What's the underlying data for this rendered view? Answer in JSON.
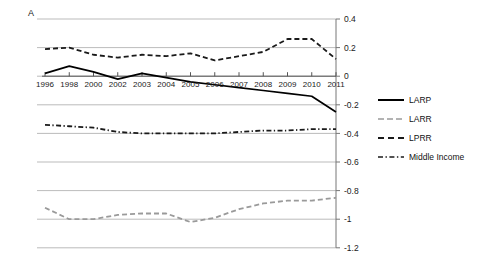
{
  "panel": {
    "label": "A"
  },
  "chart_data": {
    "type": "line",
    "title": "",
    "xlabel": "",
    "ylabel": "",
    "x": [
      1996,
      1998,
      2000,
      2002,
      2003,
      2004,
      2005,
      2006,
      2007,
      2008,
      2009,
      2010,
      2011
    ],
    "xtick_labels": [
      "1996",
      "1998",
      "2000",
      "2002",
      "2003",
      "2004",
      "2005",
      "2006",
      "2007",
      "2008",
      "2009",
      "2010",
      "2011"
    ],
    "ytick_labels": [
      "0.4",
      "0.2",
      "0",
      "-0.2",
      "-0.4",
      "-0.6",
      "-0.8",
      "-1",
      "-1.2"
    ],
    "ytick_values": [
      0.4,
      0.2,
      0,
      -0.2,
      -0.4,
      -0.6,
      -0.8,
      -1,
      -1.2
    ],
    "ylim": [
      -1.2,
      0.4
    ],
    "grid": true,
    "legend_position": "right",
    "series": [
      {
        "name": "LARP",
        "style": "solid",
        "color": "#000000",
        "values": [
          0.02,
          0.07,
          0.03,
          -0.02,
          0.02,
          -0.01,
          -0.04,
          -0.06,
          -0.08,
          -0.1,
          -0.12,
          -0.14,
          -0.25
        ]
      },
      {
        "name": "LARR",
        "style": "dashed",
        "color": "#9a9a9a",
        "values": [
          -0.92,
          -1.0,
          -1.0,
          -0.97,
          -0.96,
          -0.96,
          -1.02,
          -0.99,
          -0.93,
          -0.89,
          -0.87,
          -0.87,
          -0.85
        ]
      },
      {
        "name": "LPRR",
        "style": "dashed",
        "color": "#1a1a1a",
        "values": [
          0.19,
          0.2,
          0.15,
          0.13,
          0.15,
          0.14,
          0.16,
          0.11,
          0.14,
          0.17,
          0.26,
          0.26,
          0.12
        ]
      },
      {
        "name": "Middle Income",
        "style": "dashdot",
        "color": "#1a1a1a",
        "values": [
          -0.34,
          -0.35,
          -0.36,
          -0.39,
          -0.4,
          -0.4,
          -0.4,
          -0.4,
          -0.39,
          -0.38,
          -0.38,
          -0.37,
          -0.37
        ]
      }
    ]
  },
  "legend": {
    "items": [
      {
        "label": "LARP"
      },
      {
        "label": "LARR"
      },
      {
        "label": "LPRR"
      },
      {
        "label": "Middle Income"
      }
    ]
  }
}
